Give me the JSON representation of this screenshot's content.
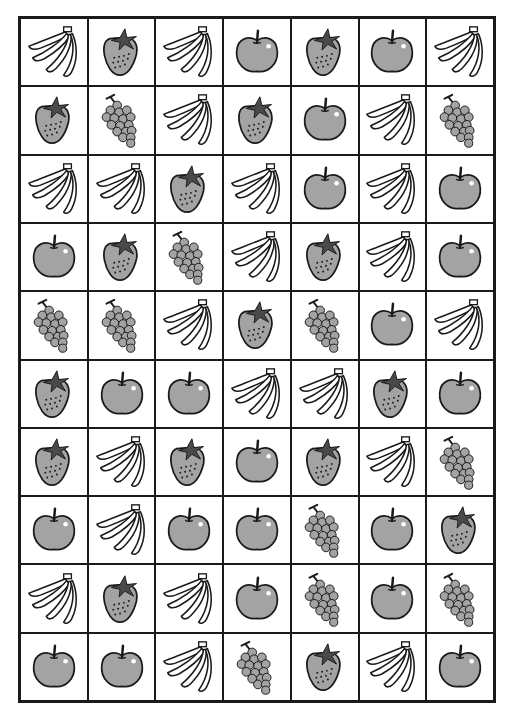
{
  "worksheet": {
    "columns": 7,
    "rows": 10,
    "colors": {
      "outline": "#1a1a1a",
      "fruit_fill": "#a3a3a3",
      "leaf_fill": "#4a4a4a",
      "highlight": "#ffffff",
      "background": "#ffffff"
    },
    "grid": [
      [
        "banana",
        "strawberry",
        "banana",
        "apple",
        "strawberry",
        "apple",
        "banana"
      ],
      [
        "strawberry",
        "grapes",
        "banana",
        "strawberry",
        "apple",
        "banana",
        "grapes"
      ],
      [
        "banana",
        "banana",
        "strawberry",
        "banana",
        "apple",
        "banana",
        "apple"
      ],
      [
        "apple",
        "strawberry",
        "grapes",
        "banana",
        "strawberry",
        "banana",
        "apple"
      ],
      [
        "grapes",
        "grapes",
        "banana",
        "strawberry",
        "grapes",
        "apple",
        "banana"
      ],
      [
        "strawberry",
        "apple",
        "apple",
        "banana",
        "banana",
        "strawberry",
        "apple"
      ],
      [
        "strawberry",
        "banana",
        "strawberry",
        "apple",
        "strawberry",
        "banana",
        "grapes"
      ],
      [
        "apple",
        "banana",
        "apple",
        "apple",
        "grapes",
        "apple",
        "strawberry"
      ],
      [
        "banana",
        "strawberry",
        "banana",
        "apple",
        "grapes",
        "apple",
        "grapes"
      ],
      [
        "apple",
        "apple",
        "banana",
        "grapes",
        "strawberry",
        "banana",
        "apple"
      ]
    ]
  }
}
